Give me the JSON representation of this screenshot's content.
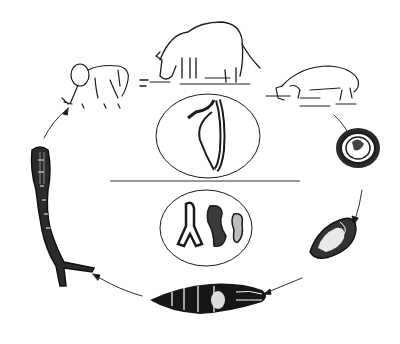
{
  "diagram": {
    "type": "life-cycle",
    "stages": [
      {
        "id": "definitive-hosts",
        "depicts": [
          "human",
          "water-buffalo",
          "pig"
        ]
      },
      {
        "id": "egg",
        "depicts": "egg"
      },
      {
        "id": "miracidium",
        "depicts": "miracidium"
      },
      {
        "id": "snail",
        "depicts": "intermediate snail host"
      },
      {
        "id": "cercaria",
        "depicts": "fork-tailed cercaria"
      }
    ],
    "center_panels": [
      {
        "id": "adult-worm-pair",
        "depicts": "adult male and female worms paired"
      },
      {
        "id": "larval-forms",
        "depicts": "cercaria head / sporocyst forms"
      }
    ],
    "flow": "clockwise: hosts → egg → miracidium → snail → cercaria → human",
    "colors": {
      "ink": "#1a1a1a",
      "background": "#ffffff"
    }
  }
}
